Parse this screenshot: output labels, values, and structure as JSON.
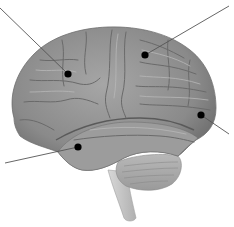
{
  "diagram": {
    "background": "#ffffff",
    "colors": {
      "cortex": "#8c8c8c",
      "cortex_dark": "#5e5e5e",
      "cortex_light": "#b5b5b5",
      "cerebellum": "#a9a9a9",
      "brainstem": "#c9c9c9",
      "leader_line": "#555555",
      "marker": "#000000"
    },
    "callouts": [
      {
        "id": "callout-1",
        "label": "",
        "dot": [
          68,
          74
        ],
        "line_end": [
          0,
          8
        ]
      },
      {
        "id": "callout-2",
        "label": "",
        "dot": [
          145,
          55
        ],
        "line_end": [
          229,
          6
        ]
      },
      {
        "id": "callout-3",
        "label": "",
        "dot": [
          201,
          115
        ],
        "line_end": [
          229,
          134
        ]
      },
      {
        "id": "callout-4",
        "label": "",
        "dot": [
          78,
          147
        ],
        "line_end": [
          5,
          163
        ]
      }
    ]
  }
}
